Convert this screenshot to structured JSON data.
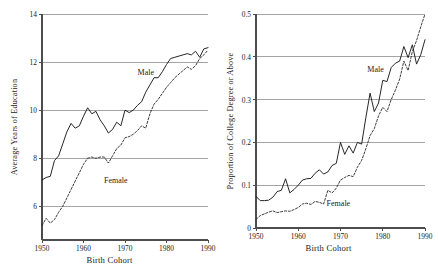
{
  "figure": {
    "background": "#ffffff",
    "gridline_color": "#9a9a9a",
    "axis_color": "#4d4d4d",
    "line_color": "#1a1a1a"
  },
  "chart_data": [
    {
      "type": "line",
      "panel": "left",
      "title": "",
      "xlabel": "Birth Cohort",
      "ylabel": "Average Years of Education",
      "xlim": [
        1950,
        1990
      ],
      "ylim": [
        4.6,
        14.0
      ],
      "xticks": [
        1950,
        1960,
        1970,
        1980,
        1990
      ],
      "xticklabels": [
        "1950",
        "1960",
        "1970",
        "1980",
        "1990"
      ],
      "yticks": [
        6,
        8,
        10,
        12,
        14
      ],
      "yticklabels": [
        "6",
        "8",
        "10",
        "12",
        "14"
      ],
      "gridlines": [
        6,
        8,
        10,
        12,
        14
      ],
      "grid": "horizontal",
      "legend_position": "inline-annotation",
      "annotations": [
        {
          "text": "Male",
          "x": 1975.0,
          "y": 11.55
        },
        {
          "text": "Female",
          "x": 1967.8,
          "y": 7.05
        }
      ],
      "x": [
        1950,
        1951,
        1952,
        1953,
        1954,
        1955,
        1956,
        1957,
        1958,
        1959,
        1960,
        1961,
        1962,
        1963,
        1964,
        1965,
        1966,
        1967,
        1968,
        1969,
        1970,
        1971,
        1972,
        1973,
        1974,
        1975,
        1976,
        1977,
        1978,
        1979,
        1980,
        1981,
        1982,
        1983,
        1984,
        1985,
        1986,
        1987,
        1988,
        1989,
        1990
      ],
      "series": [
        {
          "name": "Male",
          "style": "solid",
          "values": [
            7.1,
            7.2,
            7.25,
            7.9,
            8.1,
            8.6,
            9.1,
            9.45,
            9.25,
            9.35,
            9.75,
            10.1,
            9.85,
            9.95,
            9.6,
            9.35,
            9.05,
            9.2,
            9.5,
            9.35,
            10.0,
            9.9,
            10.0,
            10.2,
            10.35,
            10.75,
            11.05,
            11.35,
            11.35,
            11.6,
            11.9,
            12.15,
            12.2,
            12.25,
            12.3,
            12.35,
            12.3,
            12.45,
            12.2,
            12.55,
            12.6
          ]
        },
        {
          "name": "Female",
          "style": "dashed",
          "values": [
            5.2,
            5.5,
            5.3,
            5.45,
            5.75,
            6.0,
            6.35,
            6.7,
            7.05,
            7.4,
            7.75,
            8.0,
            8.05,
            8.0,
            8.05,
            8.05,
            7.8,
            8.1,
            8.4,
            8.55,
            8.85,
            8.9,
            9.0,
            9.15,
            9.35,
            9.25,
            9.85,
            10.25,
            10.45,
            10.7,
            10.95,
            11.15,
            11.35,
            11.5,
            11.65,
            11.8,
            11.7,
            11.85,
            12.15,
            12.3,
            12.5
          ]
        }
      ]
    },
    {
      "type": "line",
      "panel": "right",
      "title": "",
      "xlabel": "Birth Cohort",
      "ylabel": "Proportion of College Degree or Above",
      "xlim": [
        1950,
        1990
      ],
      "ylim": [
        0.0,
        0.5
      ],
      "xticks": [
        1950,
        1960,
        1970,
        1980,
        1990
      ],
      "xticklabels": [
        "1950",
        "1960",
        "1970",
        "1980",
        "1990"
      ],
      "yticks": [
        0,
        0.1,
        0.2,
        0.3,
        0.4,
        0.5
      ],
      "yticklabels": [
        "0",
        "0.1",
        "0.2",
        "0.3",
        "0.4",
        "0.5"
      ],
      "gridlines": [
        0,
        0.1,
        0.2,
        0.3,
        0.4,
        0.5
      ],
      "grid": "horizontal",
      "legend_position": "inline-annotation",
      "annotations": [
        {
          "text": "Male",
          "x": 1978.3,
          "y": 0.368
        },
        {
          "text": "Female",
          "x": 1969.5,
          "y": 0.055
        }
      ],
      "x": [
        1950,
        1951,
        1952,
        1953,
        1954,
        1955,
        1956,
        1957,
        1958,
        1959,
        1960,
        1961,
        1962,
        1963,
        1964,
        1965,
        1966,
        1967,
        1968,
        1969,
        1970,
        1971,
        1972,
        1973,
        1974,
        1975,
        1976,
        1977,
        1978,
        1979,
        1980,
        1981,
        1982,
        1983,
        1984,
        1985,
        1986,
        1987,
        1988,
        1989,
        1990
      ],
      "series": [
        {
          "name": "Male",
          "style": "solid",
          "values": [
            0.074,
            0.064,
            0.064,
            0.065,
            0.072,
            0.085,
            0.088,
            0.115,
            0.082,
            0.09,
            0.1,
            0.112,
            0.115,
            0.116,
            0.128,
            0.136,
            0.126,
            0.131,
            0.146,
            0.151,
            0.2,
            0.172,
            0.192,
            0.175,
            0.2,
            0.196,
            0.258,
            0.315,
            0.272,
            0.292,
            0.345,
            0.342,
            0.375,
            0.385,
            0.39,
            0.424,
            0.398,
            0.428,
            0.383,
            0.405,
            0.44
          ]
        },
        {
          "name": "Female",
          "style": "dashed",
          "values": [
            0.02,
            0.029,
            0.033,
            0.037,
            0.04,
            0.036,
            0.038,
            0.04,
            0.039,
            0.043,
            0.048,
            0.056,
            0.058,
            0.055,
            0.062,
            0.06,
            0.056,
            0.088,
            0.082,
            0.093,
            0.112,
            0.118,
            0.123,
            0.12,
            0.142,
            0.158,
            0.185,
            0.216,
            0.232,
            0.262,
            0.282,
            0.272,
            0.3,
            0.322,
            0.348,
            0.39,
            0.368,
            0.412,
            0.438,
            0.47,
            0.5
          ]
        }
      ]
    }
  ]
}
